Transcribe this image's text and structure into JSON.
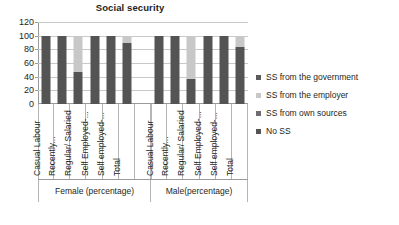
{
  "chart_data": {
    "type": "bar",
    "subtype": "stacked-column-100",
    "title": "Social security",
    "xlabel": "",
    "ylabel": "",
    "ylim": [
      0,
      120
    ],
    "yticks": [
      0,
      20,
      40,
      60,
      80,
      100,
      120
    ],
    "grid": true,
    "legend_position": "right",
    "groups": [
      "Female (percentage)",
      "Male(percentage)"
    ],
    "categories": [
      "Casual Labour",
      "Recently...",
      "Regular/ Salaried",
      "Self Employed-...",
      "Self employed-...",
      "Total"
    ],
    "series": [
      {
        "name": "SS from the government",
        "color": "#5c5c5c",
        "values_female": [
          0,
          0,
          0,
          0,
          0,
          0
        ],
        "values_male": [
          0,
          0,
          0,
          0,
          0,
          0
        ]
      },
      {
        "name": "SS from the employer",
        "color": "#c8c8c8",
        "values_female": [
          0,
          0,
          53,
          0,
          0,
          10
        ],
        "values_male": [
          0,
          0,
          63,
          0,
          0,
          17
        ]
      },
      {
        "name": "SS from own sources",
        "color": "#6e6e6e",
        "values_female": [
          0,
          0,
          0,
          0,
          0,
          0
        ],
        "values_male": [
          0,
          0,
          0,
          0,
          0,
          0
        ]
      },
      {
        "name": "No SS",
        "color": "#545454",
        "values_female": [
          100,
          100,
          47,
          100,
          100,
          90
        ],
        "values_male": [
          100,
          100,
          37,
          100,
          100,
          83
        ]
      }
    ]
  },
  "legend": {
    "items": [
      {
        "label": "SS from the government",
        "color": "#5c5c5c"
      },
      {
        "label": "SS from the employer",
        "color": "#c8c8c8"
      },
      {
        "label": "SS from own sources",
        "color": "#6e6e6e"
      },
      {
        "label": "No SS",
        "color": "#545454"
      }
    ]
  }
}
